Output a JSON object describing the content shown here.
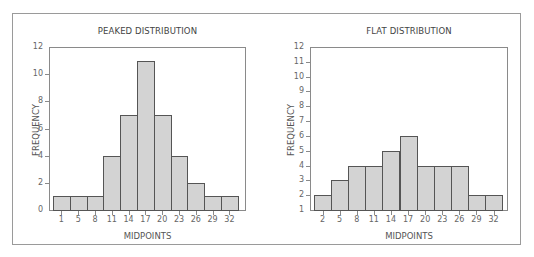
{
  "chart_data": [
    {
      "type": "bar",
      "title": "PEAKED DISTRIBUTION",
      "xlabel": "MIDPOINTS",
      "ylabel": "FREQUENCY",
      "categories": [
        "1",
        "5",
        "8",
        "11",
        "14",
        "17",
        "20",
        "23",
        "26",
        "29",
        "32"
      ],
      "values": [
        1,
        1,
        1,
        4,
        7,
        11,
        7,
        4,
        2,
        1,
        1
      ],
      "ylim": [
        0,
        12
      ],
      "yticks": [
        "0",
        "2",
        "4",
        "6",
        "8",
        "10",
        "12"
      ],
      "grid": false,
      "legend": null
    },
    {
      "type": "bar",
      "title": "FLAT DISTRIBUTION",
      "xlabel": "MIDPOINTS",
      "ylabel": "FREQUENCY",
      "categories": [
        "2",
        "5",
        "8",
        "11",
        "14",
        "17",
        "20",
        "23",
        "26",
        "29",
        "32"
      ],
      "values": [
        2,
        3,
        4,
        4,
        5,
        6,
        4,
        4,
        4,
        2,
        2
      ],
      "ylim": [
        1,
        12
      ],
      "yticks": [
        "1",
        "2",
        "3",
        "4",
        "5",
        "6",
        "7",
        "8",
        "9",
        "10",
        "11",
        "12"
      ],
      "grid": false,
      "legend": null
    }
  ],
  "colors": {
    "bar_fill": "#d3d3d3",
    "bar_border": "#555555",
    "axis": "#8a8a8a",
    "frame": "#9a9a9a"
  }
}
